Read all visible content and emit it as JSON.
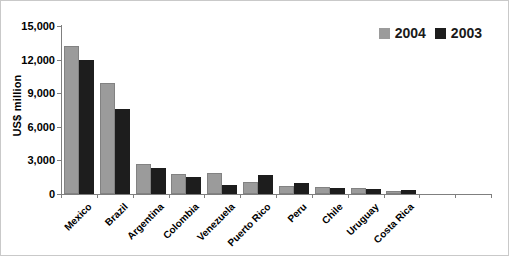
{
  "chart_data": {
    "type": "bar",
    "title": "",
    "ylabel": "US$ million",
    "xlabel": "",
    "ylim": [
      0,
      15000
    ],
    "ytick_step": 3000,
    "ytick_labels": [
      "15,000",
      "12,000",
      "9,000",
      "6,000",
      "3,000",
      "0"
    ],
    "grid": false,
    "legend_position": "top-right",
    "categories": [
      "Mexico",
      "Brazil",
      "Argentina",
      "Colombia",
      "Venezuela",
      "Puerto Rico",
      "Peru",
      "Chile",
      "Uruguay",
      "Costa Rica"
    ],
    "empty_slots_right": 2,
    "series": [
      {
        "name": "2004",
        "color": "#9b9b9b",
        "values": [
          13200,
          9900,
          2700,
          1800,
          1900,
          1100,
          700,
          650,
          550,
          300
        ]
      },
      {
        "name": "2003",
        "color": "#1d1d1d",
        "values": [
          12000,
          7600,
          2300,
          1500,
          800,
          1700,
          1000,
          500,
          450,
          350
        ]
      }
    ],
    "axis_color": "#7f7f7f"
  }
}
